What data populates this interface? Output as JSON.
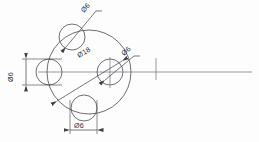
{
  "drawing": {
    "title": "Flange bolt pattern detail",
    "units": "mm",
    "line_color": "#4a4a52",
    "text_color": "#2f2f36",
    "background_color": "#fdfdfd"
  },
  "dimensions": {
    "bolt_circle": {
      "label": "Ø18",
      "value": 18,
      "symbol": "Ø",
      "kind": "diameter-bolt-circle"
    },
    "hole_top": {
      "label": "Ø6",
      "value": 6,
      "symbol": "Ø",
      "kind": "diameter-hole",
      "position": "top"
    },
    "hole_right": {
      "label": "Ø6",
      "value": 6,
      "symbol": "Ø",
      "kind": "diameter-hole",
      "position": "right"
    },
    "hole_left": {
      "label": "Ø6",
      "value": 6,
      "symbol": "Ø",
      "kind": "diameter-hole",
      "position": "left"
    },
    "hole_bottom": {
      "label": "Ø6",
      "value": 6,
      "symbol": "Ø",
      "kind": "diameter-hole",
      "position": "bottom"
    }
  },
  "geometry": {
    "bolt_circle_center": {
      "x": 89,
      "y": 72
    },
    "bolt_circle_radius": 42,
    "hole_radius": 13,
    "holes": [
      {
        "name": "top",
        "x": 72,
        "y": 37
      },
      {
        "name": "right",
        "x": 110,
        "y": 72
      },
      {
        "name": "bottom",
        "x": 84,
        "y": 108
      },
      {
        "name": "left",
        "x": 49,
        "y": 72
      }
    ],
    "centerline_horizontal": {
      "x1": 38,
      "y1": 72,
      "x2": 252,
      "y2": 72
    },
    "centerline_tick": {
      "x": 156,
      "y1": 58,
      "y2": 80
    }
  }
}
